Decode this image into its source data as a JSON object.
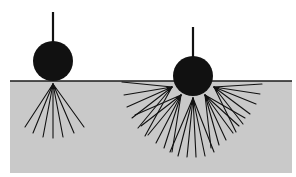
{
  "diagram": {
    "colors": {
      "background": "#ffffff",
      "material": "#c9c9c9",
      "ink": "#111111",
      "surface_line": "#1a1a1a"
    },
    "material_block": {
      "x": 10,
      "y": 81,
      "width": 282,
      "height": 92
    },
    "surface_line": {
      "y": 81,
      "x1": 10,
      "x2": 292
    },
    "left_indenter": {
      "label": "shallow-contact",
      "rod": {
        "x": 53,
        "y1": 12,
        "y2": 42
      },
      "ball": {
        "cx": 53,
        "cy": 61,
        "r": 20
      },
      "fan_origin": {
        "x": 53,
        "y": 84
      },
      "ray_ends": [
        [
          25,
          127
        ],
        [
          33,
          133
        ],
        [
          43,
          137
        ],
        [
          53,
          138
        ],
        [
          63,
          137
        ],
        [
          74,
          133
        ],
        [
          84,
          127
        ]
      ]
    },
    "right_indenter": {
      "label": "deep-contact",
      "rod": {
        "x": 193,
        "y1": 27,
        "y2": 57
      },
      "ball": {
        "cx": 193,
        "cy": 76,
        "r": 20
      },
      "fans": [
        {
          "origin": [
            172,
            87
          ],
          "ends": [
            [
              122,
              82
            ],
            [
              124,
              95
            ],
            [
              127,
              107
            ],
            [
              132,
              118
            ],
            [
              138,
              128
            ],
            [
              145,
              136
            ]
          ]
        },
        {
          "origin": [
            181,
            95
          ],
          "ends": [
            [
              135,
              115
            ],
            [
              141,
              126
            ],
            [
              148,
              135
            ],
            [
              156,
              143
            ],
            [
              164,
              148
            ],
            [
              172,
              152
            ]
          ]
        },
        {
          "origin": [
            193,
            98
          ],
          "ends": [
            [
              170,
              152
            ],
            [
              178,
              156
            ],
            [
              187,
              157
            ],
            [
              196,
              157
            ],
            [
              205,
              156
            ],
            [
              214,
              152
            ]
          ]
        },
        {
          "origin": [
            205,
            95
          ],
          "ends": [
            [
              211,
              148
            ],
            [
              219,
              145
            ],
            [
              226,
              140
            ],
            [
              233,
              133
            ],
            [
              239,
              126
            ],
            [
              245,
              118
            ]
          ]
        },
        {
          "origin": [
            214,
            87
          ],
          "ends": [
            [
              236,
              132
            ],
            [
              243,
              124
            ],
            [
              250,
              114
            ],
            [
              256,
              104
            ],
            [
              260,
              94
            ],
            [
              262,
              84
            ]
          ]
        }
      ]
    }
  }
}
